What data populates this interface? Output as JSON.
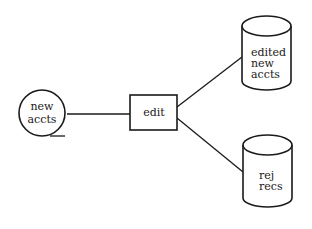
{
  "diagram": {
    "type": "data-flow",
    "nodes": [
      {
        "id": "new_accts",
        "shape": "tape",
        "lines": [
          "new",
          "accts"
        ]
      },
      {
        "id": "edit",
        "shape": "process-box",
        "lines": [
          "edit"
        ]
      },
      {
        "id": "edited_new_accts",
        "shape": "disk-cylinder",
        "lines": [
          "edited",
          "new",
          "accts"
        ]
      },
      {
        "id": "rej_recs",
        "shape": "disk-cylinder",
        "lines": [
          "rej",
          "recs"
        ]
      }
    ],
    "edges": [
      {
        "from": "new_accts",
        "to": "edit"
      },
      {
        "from": "edit",
        "to": "edited_new_accts"
      },
      {
        "from": "edit",
        "to": "rej_recs"
      }
    ],
    "colors": {
      "ink": "#1a1a1a",
      "background": "#ffffff"
    }
  }
}
